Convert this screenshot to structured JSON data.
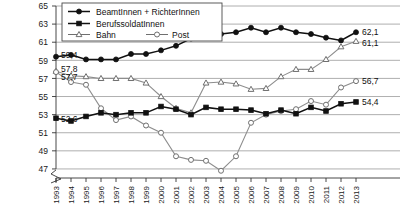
{
  "chart_data": {
    "type": "line",
    "title": "",
    "subtitle": "",
    "xlabel": "",
    "ylabel": "",
    "xlim": [
      1993,
      2013
    ],
    "ylim": [
      46,
      65
    ],
    "yticks": [
      47,
      49,
      51,
      53,
      55,
      57,
      59,
      61,
      63,
      65
    ],
    "ytick_labels": [
      "47",
      "49",
      "51",
      "53",
      "55",
      "57",
      "59",
      "61",
      "63",
      "65"
    ],
    "grid": "horizontal",
    "axis_break": true,
    "legend_position": "top-left",
    "decimal_separator": ",",
    "categories": [
      1993,
      1994,
      1995,
      1996,
      1997,
      1998,
      1999,
      2000,
      2001,
      2002,
      2003,
      2004,
      2005,
      2006,
      2007,
      2008,
      2009,
      2010,
      2011,
      2012,
      2013
    ],
    "xtick_labels": [
      "1993",
      "1994",
      "1995",
      "1996",
      "1997",
      "1998",
      "1999",
      "2000",
      "2001",
      "2002",
      "2003",
      "2004",
      "2005",
      "2006",
      "2007",
      "2008",
      "2009",
      "2010",
      "2011",
      "2012",
      "2013"
    ],
    "series": [
      {
        "name": "BeamtInnen + RichterInnen",
        "marker": "filled-circle",
        "line_style": "solid-dark",
        "start_label": "59,4",
        "end_label": "62,1",
        "values": [
          59.4,
          59.6,
          59.1,
          59.1,
          59.1,
          59.7,
          59.7,
          60.1,
          60.6,
          61.4,
          61.7,
          61.9,
          62.1,
          62.6,
          62.1,
          62.6,
          62.1,
          61.9,
          61.5,
          61.2,
          62.1
        ]
      },
      {
        "name": "BerufssoldatInnen",
        "marker": "filled-square",
        "line_style": "solid-dark",
        "start_label": "52,6",
        "end_label": "54,4",
        "values": [
          52.6,
          52.3,
          52.8,
          53.2,
          53.0,
          53.2,
          53.2,
          53.9,
          53.6,
          53.0,
          53.8,
          53.6,
          53.6,
          53.5,
          53.1,
          53.5,
          53.1,
          53.8,
          53.4,
          54.2,
          54.4
        ]
      },
      {
        "name": "Bahn",
        "marker": "open-triangle",
        "line_style": "light",
        "start_label": "57,8",
        "end_label": "61,1",
        "values": [
          57.8,
          57.3,
          57.2,
          57.0,
          57.0,
          57.0,
          56.5,
          55.0,
          53.7,
          53.2,
          56.5,
          56.6,
          56.4,
          55.8,
          55.9,
          57.2,
          58.0,
          58.0,
          59.1,
          60.5,
          61.1
        ]
      },
      {
        "name": "Post",
        "marker": "open-circle",
        "line_style": "light",
        "start_label": "57,7",
        "end_label": "56,7",
        "values": [
          57.7,
          56.6,
          56.3,
          53.7,
          52.4,
          52.8,
          51.8,
          51.0,
          48.4,
          48.0,
          47.9,
          46.8,
          48.4,
          52.1,
          53.0,
          53.4,
          53.6,
          54.5,
          54.1,
          56.0,
          56.7
        ]
      }
    ]
  },
  "legend": {
    "items": [
      {
        "label": "BeamtInnen + RichterInnen",
        "marker": "filled-circle"
      },
      {
        "label": "BerufssoldatInnen",
        "marker": "filled-square"
      },
      {
        "label": "Bahn",
        "marker": "open-triangle"
      },
      {
        "label": "Post",
        "marker": "open-circle"
      }
    ]
  }
}
